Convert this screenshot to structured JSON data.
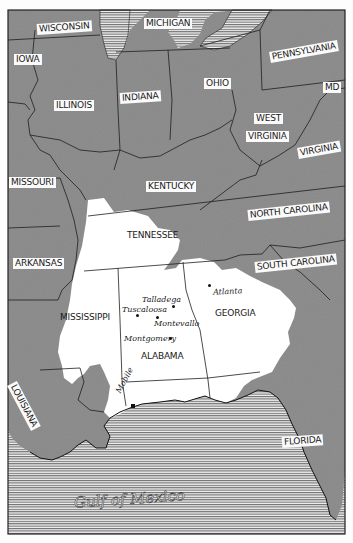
{
  "map": {
    "colors": {
      "land": "#8f8f8f",
      "highlight_region": "#ffffff",
      "water_hatch": "#7a7a7a",
      "border": "#1e1e1e",
      "background": "#fdfdfd"
    },
    "states": [
      {
        "id": "wisconsin",
        "label": "WISCONSIN"
      },
      {
        "id": "michigan",
        "label": "MICHIGAN"
      },
      {
        "id": "iowa",
        "label": "IOWA"
      },
      {
        "id": "pennsylvania",
        "label": "PENNSYLVANIA"
      },
      {
        "id": "illinois",
        "label": "ILLINOIS"
      },
      {
        "id": "indiana",
        "label": "INDIANA"
      },
      {
        "id": "ohio",
        "label": "OHIO"
      },
      {
        "id": "maryland",
        "label": "MD"
      },
      {
        "id": "west-virginia-1",
        "label": "WEST"
      },
      {
        "id": "west-virginia-2",
        "label": "VIRGINIA"
      },
      {
        "id": "virginia",
        "label": "VIRGINIA"
      },
      {
        "id": "missouri",
        "label": "MISSOURI"
      },
      {
        "id": "kentucky",
        "label": "KENTUCKY"
      },
      {
        "id": "north-carolina",
        "label": "NORTH CAROLINA"
      },
      {
        "id": "tennessee",
        "label": "TENNESSEE"
      },
      {
        "id": "arkansas",
        "label": "ARKANSAS"
      },
      {
        "id": "south-carolina",
        "label": "SOUTH CAROLINA"
      },
      {
        "id": "mississippi",
        "label": "MISSISSIPPI"
      },
      {
        "id": "georgia",
        "label": "GEORGIA"
      },
      {
        "id": "alabama",
        "label": "ALABAMA"
      },
      {
        "id": "louisiana",
        "label": "LOUISIANA"
      },
      {
        "id": "florida",
        "label": "FLORIDA"
      }
    ],
    "cities": [
      {
        "id": "atlanta",
        "label": "Atlanta"
      },
      {
        "id": "talladega",
        "label": "Talladega"
      },
      {
        "id": "tuscaloosa",
        "label": "Tuscaloosa"
      },
      {
        "id": "montevallo",
        "label": "Montevallo"
      },
      {
        "id": "montgomery",
        "label": "Montgomery"
      },
      {
        "id": "mobile",
        "label": "Mobile"
      }
    ],
    "water": {
      "gulf_label": "Gulf of Mexico"
    }
  }
}
